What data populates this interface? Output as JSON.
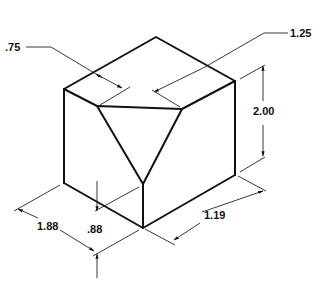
{
  "figure": {
    "type": "isometric-technical-drawing",
    "dimensions": {
      "top_left_offset": ".75",
      "top_right_offset": "1.25",
      "height": "2.00",
      "depth_left": "1.88",
      "cut_depth": ".88",
      "width_right": "1.19"
    }
  }
}
